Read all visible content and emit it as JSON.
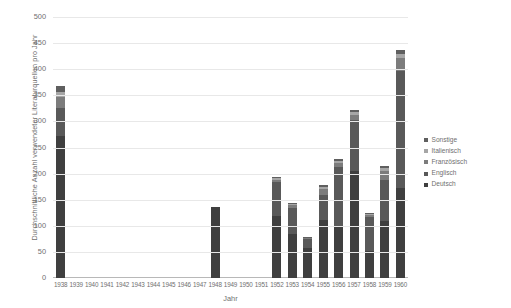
{
  "chart_data": {
    "type": "bar",
    "stacked": true,
    "title": "",
    "xlabel": "Jahr",
    "ylabel": "Durchschnittliche Anzahl verwendeter Literaturquellen pro Jahr",
    "ylim": [
      0,
      500
    ],
    "yticks": [
      0,
      50,
      100,
      150,
      200,
      250,
      300,
      350,
      400,
      450,
      500
    ],
    "grid": true,
    "legend_position": "right",
    "categories": [
      "1938",
      "1939",
      "1940",
      "1941",
      "1942",
      "1943",
      "1944",
      "1945",
      "1946",
      "1947",
      "1948",
      "1949",
      "1950",
      "1951",
      "1952",
      "1953",
      "1954",
      "1955",
      "1956",
      "1957",
      "1958",
      "1959",
      "1960"
    ],
    "series": [
      {
        "name": "Deutsch",
        "color": "#3f3f3f",
        "values": [
          272,
          0,
          0,
          0,
          0,
          0,
          0,
          0,
          0,
          0,
          137,
          0,
          0,
          0,
          118,
          85,
          58,
          112,
          100,
          205,
          52,
          110,
          172
        ]
      },
      {
        "name": "Englisch",
        "color": "#595959",
        "values": [
          53,
          0,
          0,
          0,
          0,
          0,
          0,
          0,
          0,
          0,
          0,
          0,
          0,
          0,
          65,
          50,
          16,
          47,
          112,
          98,
          64,
          78,
          225
        ]
      },
      {
        "name": "Französisch",
        "color": "#7c7c7c",
        "values": [
          22,
          0,
          0,
          0,
          0,
          0,
          0,
          0,
          0,
          0,
          0,
          0,
          0,
          0,
          5,
          4,
          2,
          12,
          8,
          10,
          4,
          18,
          24
        ]
      },
      {
        "name": "Italienisch",
        "color": "#a6a6a6",
        "values": [
          9,
          0,
          0,
          0,
          0,
          0,
          0,
          0,
          0,
          0,
          0,
          0,
          0,
          0,
          3,
          2,
          1,
          4,
          4,
          5,
          2,
          5,
          8
        ]
      },
      {
        "name": "Sonstige",
        "color": "#5f5f5f",
        "values": [
          11,
          0,
          0,
          0,
          0,
          0,
          0,
          0,
          0,
          0,
          0,
          0,
          0,
          0,
          2,
          2,
          1,
          3,
          4,
          4,
          2,
          4,
          7
        ]
      }
    ],
    "legend": [
      {
        "label": "Sonstige",
        "color": "#5f5f5f"
      },
      {
        "label": "Italienisch",
        "color": "#a6a6a6"
      },
      {
        "label": "Französisch",
        "color": "#7c7c7c"
      },
      {
        "label": "Englisch",
        "color": "#595959"
      },
      {
        "label": "Deutsch",
        "color": "#3f3f3f"
      }
    ]
  }
}
